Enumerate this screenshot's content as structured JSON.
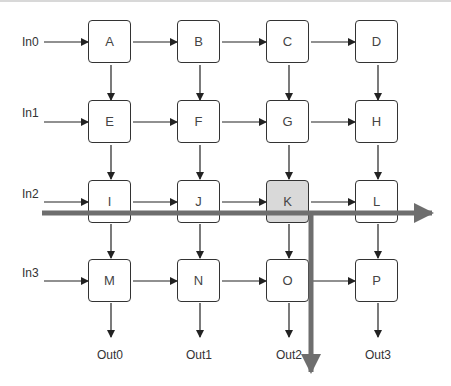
{
  "diagram": {
    "inputs": [
      "In0",
      "In1",
      "In2",
      "In3"
    ],
    "outputs": [
      "Out0",
      "Out1",
      "Out2",
      "Out3"
    ],
    "nodes": [
      [
        "A",
        "B",
        "C",
        "D"
      ],
      [
        "E",
        "F",
        "G",
        "H"
      ],
      [
        "I",
        "J",
        "K",
        "L"
      ],
      [
        "M",
        "N",
        "O",
        "P"
      ]
    ],
    "highlighted_node": "K",
    "highlight_paths": [
      {
        "direction": "horizontal",
        "row": "In2",
        "through": "K"
      },
      {
        "direction": "vertical",
        "column": "Out2",
        "from": "K"
      }
    ],
    "colors": {
      "highlight_node": "#d9d9d9",
      "highlight_path": "#6e6e6e",
      "stroke": "#333333"
    }
  }
}
